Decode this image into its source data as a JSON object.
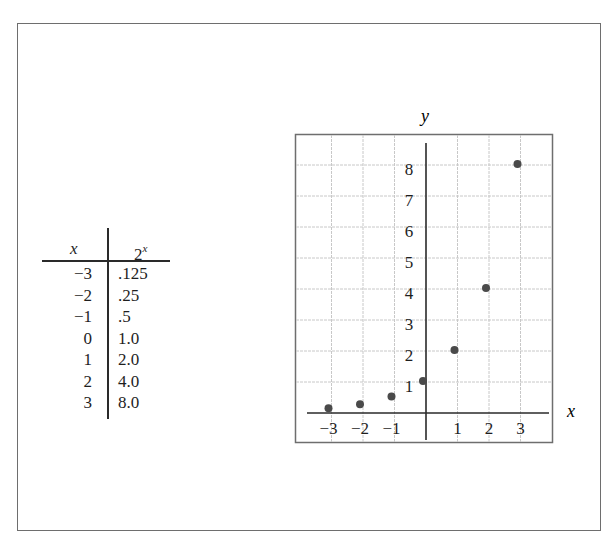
{
  "table": {
    "header_x": "x",
    "header_fx_base": "2",
    "header_fx_exp": "x",
    "rows": [
      {
        "x": "−3",
        "fx": ".125"
      },
      {
        "x": "−2",
        "fx": ".25"
      },
      {
        "x": "−1",
        "fx": ".5"
      },
      {
        "x": "0",
        "fx": "1.0"
      },
      {
        "x": "1",
        "fx": "2.0"
      },
      {
        "x": "2",
        "fx": "4.0"
      },
      {
        "x": "3",
        "fx": "8.0"
      }
    ]
  },
  "colors": {
    "frame": "#6e6e6e",
    "axis": "#2a2a2a",
    "grid": "#c8c8c8",
    "point": "#4a4a4a",
    "text": "#1e1e1e"
  },
  "chart_data": {
    "type": "scatter",
    "title": "",
    "xlabel": "x",
    "ylabel": "y",
    "x": [
      -3,
      -2,
      -1,
      0,
      1,
      2,
      3
    ],
    "y": [
      0.125,
      0.25,
      0.5,
      1,
      2,
      4,
      8
    ],
    "series": [
      {
        "name": "y = 2^x",
        "x": [
          -3,
          -2,
          -1,
          0,
          1,
          2,
          3
        ],
        "y": [
          0.125,
          0.25,
          0.5,
          1,
          2,
          4,
          8
        ]
      }
    ],
    "x_tick_labels": [
      "−3",
      "−2",
      "−1",
      "1",
      "2",
      "3"
    ],
    "x_ticks": [
      -3,
      -2,
      -1,
      1,
      2,
      3
    ],
    "y_tick_labels": [
      "1",
      "2",
      "3",
      "4",
      "5",
      "6",
      "7",
      "8"
    ],
    "y_ticks": [
      1,
      2,
      3,
      4,
      5,
      6,
      7,
      8
    ],
    "xlim": [
      -4,
      4
    ],
    "ylim": [
      -1,
      9
    ],
    "grid": true,
    "legend": "none"
  }
}
